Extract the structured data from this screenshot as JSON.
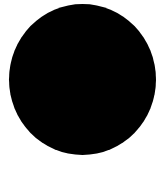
{
  "canvas": {
    "background": "#ffffff"
  },
  "shape": {
    "type": "circle",
    "color": "#000000"
  }
}
